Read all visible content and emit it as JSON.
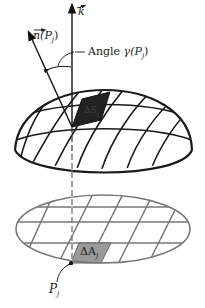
{
  "figure": {
    "labels": {
      "k_vector": "k",
      "normal_vector": "n(P",
      "normal_sub": "j",
      "normal_close": ")",
      "angle_word": "Angle",
      "angle_symbol": "γ(P",
      "angle_sub": "j",
      "angle_close": ")",
      "surface_patch": "ΔS",
      "surface_sub": "j",
      "plane_patch": "ΔA",
      "plane_sub": "j",
      "point": "P",
      "point_sub": "j"
    },
    "colors": {
      "dome_lines": "#1a1a1a",
      "plane_lines": "#777777",
      "dark_patch": "#222222",
      "plane_patch": "#9a9a9a"
    }
  }
}
